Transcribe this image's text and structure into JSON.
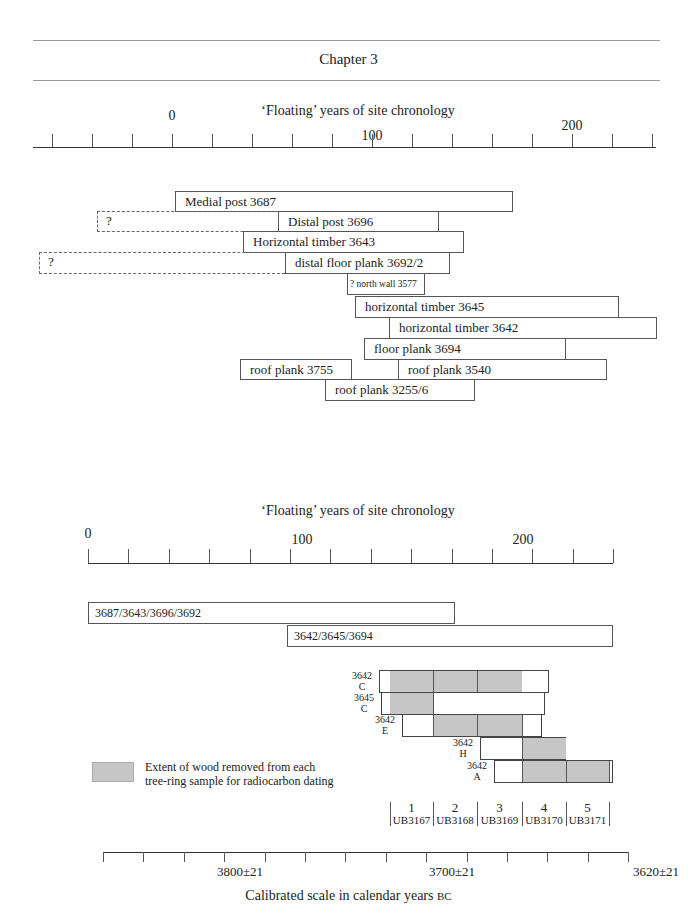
{
  "header": {
    "title": "Chapter 3"
  },
  "top_chart": {
    "axis_title": "‘Floating’ years of site chronology",
    "tick_labels": [
      {
        "text": "0",
        "x": 172,
        "y": 108
      },
      {
        "text": "100",
        "x": 372,
        "y": 128
      },
      {
        "text": "200",
        "x": 572,
        "y": 118
      }
    ],
    "timbers": [
      {
        "label": "Medial post 3687",
        "x1": 175,
        "x2": 513,
        "y": 191,
        "h": 21
      },
      {
        "label": "Distal post 3696",
        "x1": 278,
        "x2": 439,
        "y": 211,
        "h": 21,
        "dashed_from": 97,
        "dashed_label": "?"
      },
      {
        "label": "Horizontal timber 3643",
        "x1": 243,
        "x2": 464,
        "y": 231,
        "h": 22
      },
      {
        "label": "distal floor plank 3692/2",
        "x1": 285,
        "x2": 450,
        "y": 252,
        "h": 22,
        "dashed_from": 39,
        "dashed_label": "?"
      },
      {
        "label": "? north wall 3577",
        "x1": 347,
        "x2": 425,
        "y": 273,
        "h": 22,
        "small": true
      },
      {
        "label": "horizontal timber 3645",
        "x1": 355,
        "x2": 619,
        "y": 296,
        "h": 22
      },
      {
        "label": "horizontal timber 3642",
        "x1": 389,
        "x2": 657,
        "y": 317,
        "h": 22
      },
      {
        "label": "floor plank 3694",
        "x1": 364,
        "x2": 566,
        "y": 338,
        "h": 22
      },
      {
        "label": "roof plank 3755",
        "x1": 240,
        "x2": 352,
        "y": 359,
        "h": 21
      },
      {
        "label": "roof plank 3540",
        "x1": 398,
        "x2": 607,
        "y": 359,
        "h": 21
      },
      {
        "label": "roof plank 3255/6",
        "x1": 325,
        "x2": 475,
        "y": 379,
        "h": 22
      }
    ]
  },
  "bottom_chart": {
    "axis_title": "‘Floating’ years of site chronology",
    "tick_labels": [
      {
        "text": "0",
        "x": 88,
        "y": 526
      },
      {
        "text": "100",
        "x": 302,
        "y": 532
      },
      {
        "text": "200",
        "x": 523,
        "y": 532
      }
    ],
    "composites": [
      {
        "label": "3687/3643/3696/3692",
        "x1": 88,
        "x2": 455,
        "y": 602,
        "h": 22
      },
      {
        "label": "3642/3645/3694",
        "x1": 287,
        "x2": 613,
        "y": 625,
        "h": 22
      }
    ],
    "samples": [
      {
        "timber": "3642",
        "letter": "C",
        "x1": 379,
        "x2": 549,
        "y": 670,
        "h": 23,
        "gray": [
          [
            390,
            522
          ]
        ],
        "dividers": [
          433,
          477
        ]
      },
      {
        "timber": "3645",
        "letter": "C",
        "x1": 381,
        "x2": 545,
        "y": 692,
        "h": 23,
        "gray": [
          [
            390,
            433
          ]
        ],
        "dividers": [
          433
        ]
      },
      {
        "timber": "3642",
        "letter": "E",
        "x1": 402,
        "x2": 542,
        "y": 714,
        "h": 23,
        "gray": [
          [
            433,
            522
          ]
        ],
        "dividers": [
          433,
          477,
          522
        ]
      },
      {
        "timber": "3642",
        "letter": "H",
        "x1": 480,
        "x2": 566,
        "y": 737,
        "h": 23,
        "gray": [
          [
            522,
            566
          ]
        ],
        "dividers": [
          522
        ]
      },
      {
        "timber": "3642",
        "letter": "A",
        "x1": 494,
        "x2": 613,
        "y": 760,
        "h": 23,
        "gray": [
          [
            522,
            609
          ]
        ],
        "dividers": [
          522,
          566,
          609
        ]
      }
    ],
    "legend": {
      "line1": "Extent of wood removed from each",
      "line2": "tree-ring sample for radiocarbon dating"
    },
    "radiocarbon_runs": [
      {
        "num": "1",
        "code": "UB3167",
        "x1": 390,
        "x2": 433
      },
      {
        "num": "2",
        "code": "UB3168",
        "x1": 433,
        "x2": 477
      },
      {
        "num": "3",
        "code": "UB3169",
        "x1": 477,
        "x2": 522
      },
      {
        "num": "4",
        "code": "UB3170",
        "x1": 522,
        "x2": 566
      },
      {
        "num": "5",
        "code": "UB3171",
        "x1": 566,
        "x2": 609
      }
    ],
    "calibrated_axis": {
      "labels": [
        {
          "text": "3800±21",
          "x": 240
        },
        {
          "text": "3700±21",
          "x": 452
        },
        {
          "text": "3620±21",
          "x": 656
        }
      ],
      "title": "Calibrated scale in calendar years",
      "title_suffix": "BC"
    }
  },
  "chart_data": [
    {
      "type": "bar",
      "title": "‘Floating’ years of site chronology",
      "xlabel": "‘Floating’ years",
      "xlim": [
        -60,
        240
      ],
      "tick_labels": [
        "0",
        "100",
        "200"
      ],
      "series": [
        {
          "name": "Medial post 3687",
          "start": 2,
          "end": 170
        },
        {
          "name": "Distal post 3696",
          "start": 53,
          "end": 134,
          "uncertain_start": -37
        },
        {
          "name": "Horizontal timber 3643",
          "start": 36,
          "end": 146
        },
        {
          "name": "distal floor plank 3692/2",
          "start": 57,
          "end": 139,
          "uncertain_start": -66
        },
        {
          "name": "? north wall 3577",
          "start": 88,
          "end": 126
        },
        {
          "name": "horizontal timber 3645",
          "start": 92,
          "end": 224
        },
        {
          "name": "horizontal timber 3642",
          "start": 109,
          "end": 243
        },
        {
          "name": "floor plank 3694",
          "start": 96,
          "end": 197
        },
        {
          "name": "roof plank 3755",
          "start": 34,
          "end": 90
        },
        {
          "name": "roof plank 3540",
          "start": 113,
          "end": 218
        },
        {
          "name": "roof plank 3255/6",
          "start": 77,
          "end": 152
        }
      ]
    },
    {
      "type": "bar",
      "title": "‘Floating’ years of site chronology",
      "xlabel": "Calibrated scale in calendar years BC",
      "xlim": [
        0,
        240
      ],
      "tick_labels": [
        "0",
        "100",
        "200"
      ],
      "series": [
        {
          "name": "3687/3643/3696/3692",
          "start": 0,
          "end": 180
        },
        {
          "name": "3642/3645/3694",
          "start": 98,
          "end": 258
        }
      ],
      "samples": [
        {
          "name": "3642 C",
          "radiocarbon_blocks": [
            1,
            2,
            3
          ]
        },
        {
          "name": "3645 C",
          "radiocarbon_blocks": [
            1
          ]
        },
        {
          "name": "3642 E",
          "radiocarbon_blocks": [
            2,
            3
          ]
        },
        {
          "name": "3642 H",
          "radiocarbon_blocks": [
            4
          ]
        },
        {
          "name": "3642 A",
          "radiocarbon_blocks": [
            4,
            5
          ]
        }
      ],
      "radiocarbon_runs": [
        "1 UB3167",
        "2 UB3168",
        "3 UB3169",
        "4 UB3170",
        "5 UB3171"
      ],
      "calibrated_ticks": [
        "3800±21",
        "3700±21",
        "3620±21"
      ],
      "legend": "Extent of wood removed from each tree-ring sample for radiocarbon dating"
    }
  ]
}
